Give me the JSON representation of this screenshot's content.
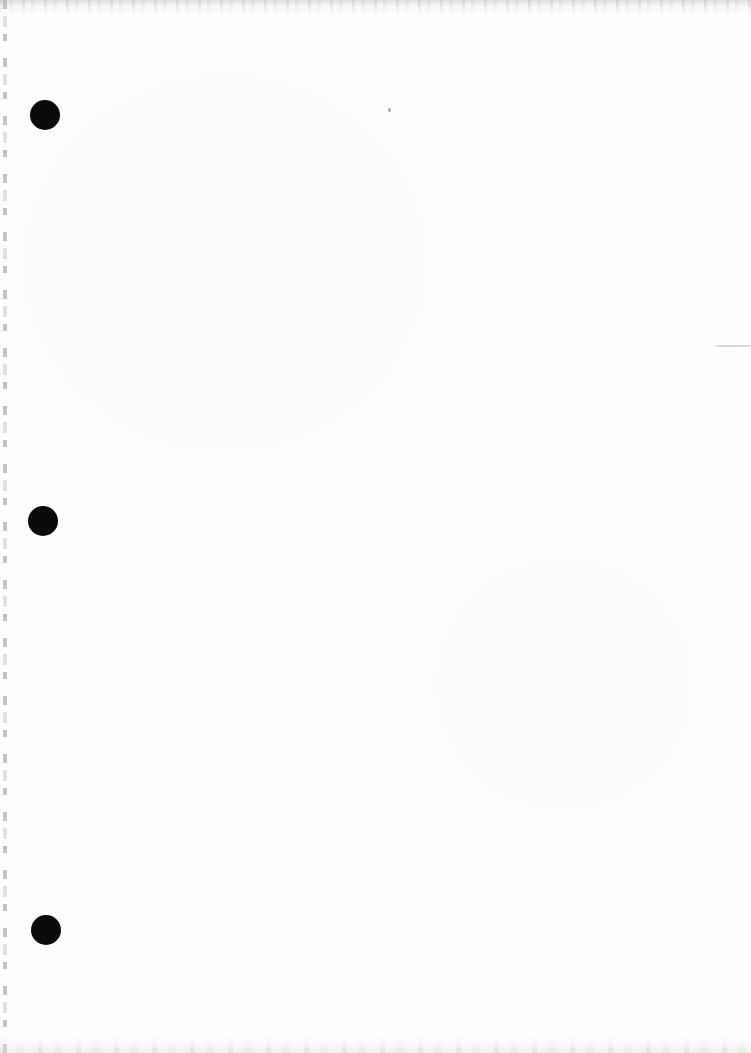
{
  "document": {
    "kind": "scanned-page",
    "page_label": "",
    "visible_text": "",
    "background_color": "#fefefe",
    "ink_color": "#0b0b0b",
    "width_px": 751,
    "height_px": 1053
  },
  "punch_holes": [
    {
      "name": "punch-hole-top",
      "cx": 45,
      "cy": 115,
      "r": 15
    },
    {
      "name": "punch-hole-middle",
      "cx": 43,
      "cy": 521,
      "r": 15
    },
    {
      "name": "punch-hole-bottom",
      "cx": 46,
      "cy": 930,
      "r": 15
    }
  ],
  "scan_artifacts": {
    "left_edge_line": {
      "x": 3,
      "y": 0,
      "width": 4,
      "height": 1053,
      "color": "#a0a2a7"
    },
    "top_edge_shadow": {
      "x": 0,
      "y": 0,
      "width": 751,
      "height": 16,
      "color": "#c4c6c9"
    },
    "bottom_edge_smudge": {
      "x": 0,
      "y": 1035,
      "width": 751,
      "height": 18,
      "color": "#dedfe2"
    },
    "right_rule": {
      "x": 713,
      "y": 345,
      "width": 38,
      "height": 2,
      "color": "#c4c6ca"
    },
    "speck": {
      "x": 388,
      "y": 108,
      "width": 3,
      "height": 4,
      "color": "#969a9c"
    }
  }
}
